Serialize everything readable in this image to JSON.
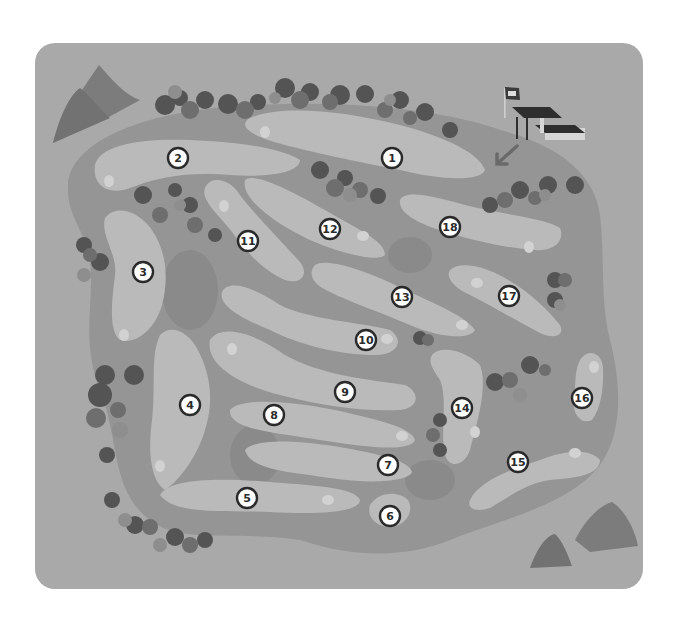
{
  "map": {
    "title": "Golf course map",
    "colors": {
      "background": "#ffffff",
      "board": "#a9a9a9",
      "rough": "#959595",
      "rough_dark": "#8a8a8a",
      "fairway": "#bababa",
      "fairway_inner": "#c4c4c4",
      "tee": "#d2d2d2",
      "tree_dark": "#545454",
      "tree_mid": "#6e6e6e",
      "tree_light": "#8e8e8e",
      "mountain": "#7c7c7c",
      "marker_fill": "#ffffff",
      "marker_stroke": "#2a2a2a",
      "clubhouse_roof": "#2e2e2e",
      "clubhouse_wall": "#d6d6d6"
    },
    "holes": [
      {
        "number": "1",
        "x": 392,
        "y": 158
      },
      {
        "number": "2",
        "x": 178,
        "y": 158
      },
      {
        "number": "3",
        "x": 143,
        "y": 272
      },
      {
        "number": "4",
        "x": 190,
        "y": 405
      },
      {
        "number": "5",
        "x": 247,
        "y": 498
      },
      {
        "number": "6",
        "x": 390,
        "y": 516
      },
      {
        "number": "7",
        "x": 388,
        "y": 465
      },
      {
        "number": "8",
        "x": 274,
        "y": 415
      },
      {
        "number": "9",
        "x": 345,
        "y": 392
      },
      {
        "number": "10",
        "x": 366,
        "y": 340
      },
      {
        "number": "11",
        "x": 248,
        "y": 241
      },
      {
        "number": "12",
        "x": 330,
        "y": 229
      },
      {
        "number": "13",
        "x": 402,
        "y": 297
      },
      {
        "number": "14",
        "x": 462,
        "y": 408
      },
      {
        "number": "15",
        "x": 518,
        "y": 462
      },
      {
        "number": "16",
        "x": 582,
        "y": 398
      },
      {
        "number": "17",
        "x": 509,
        "y": 296
      },
      {
        "number": "18",
        "x": 450,
        "y": 227
      }
    ],
    "icons": {
      "flag": "flag-icon",
      "clubhouse": "clubhouse-icon",
      "arrow": "arrow-down-left-icon",
      "mountain": "mountain-icon",
      "trees": "tree-cluster-icon"
    }
  }
}
